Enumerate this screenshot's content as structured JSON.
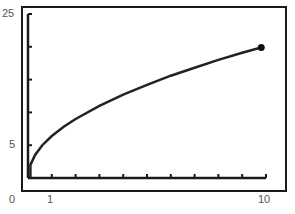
{
  "chart_data": {
    "type": "line",
    "title": "",
    "xlabel": "",
    "ylabel": "",
    "xlim": [
      0,
      10
    ],
    "ylim": [
      0,
      25
    ],
    "grid": false,
    "legend": null,
    "x_tick_labels": [
      {
        "value": 0,
        "label": "0"
      },
      {
        "value": 1,
        "label": "1"
      },
      {
        "value": 10,
        "label": "10"
      }
    ],
    "y_tick_labels": [
      {
        "value": 25,
        "label": "25"
      },
      {
        "value": 5,
        "label": "5"
      }
    ],
    "x_minor_ticks": [
      1,
      2,
      3,
      4,
      5,
      6,
      7,
      8,
      9,
      10
    ],
    "y_minor_ticks": [
      5,
      10,
      15,
      20,
      25
    ],
    "series": [
      {
        "name": "curve",
        "style": "solid",
        "color": "#222222",
        "x": [
          0.1,
          0.3,
          0.6,
          1,
          1.5,
          2,
          3,
          4,
          5,
          6,
          7,
          8,
          9,
          9.8
        ],
        "y": [
          2.0,
          3.5,
          5.0,
          6.4,
          7.8,
          9.0,
          11.0,
          12.7,
          14.2,
          15.6,
          16.8,
          18.0,
          19.1,
          19.9
        ]
      }
    ],
    "endpoint_marker": {
      "x": 9.8,
      "y": 19.9,
      "shape": "filled-circle"
    }
  },
  "labels": {
    "y_top": "25",
    "y_mid": "5",
    "origin": "0",
    "x_one": "1",
    "x_ten": "10"
  }
}
